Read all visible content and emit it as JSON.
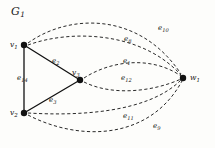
{
  "figure": {
    "title": "G",
    "title_sub": "1",
    "background_color": "#fdfdfb",
    "ink_color": "#111111"
  },
  "nodes": [
    {
      "id": "v1",
      "label": "v",
      "sub": "1",
      "x": 24,
      "y": 45,
      "label_x": 10,
      "label_y": 40
    },
    {
      "id": "v2",
      "label": "v",
      "sub": "2",
      "x": 24,
      "y": 113,
      "label_x": 10,
      "label_y": 108
    },
    {
      "id": "v3",
      "label": "v",
      "sub": "3",
      "x": 80,
      "y": 80,
      "label_x": 72,
      "label_y": 68
    },
    {
      "id": "w1",
      "label": "w",
      "sub": "1",
      "x": 183,
      "y": 78,
      "label_x": 190,
      "label_y": 73
    }
  ],
  "solid_edges": [
    {
      "id": "e14",
      "label": "e",
      "sub": "14",
      "from": "v1",
      "to": "v2",
      "label_x": 17,
      "label_y": 74
    },
    {
      "id": "e2",
      "label": "e",
      "sub": "2",
      "from": "v1",
      "to": "v3",
      "label_x": 52,
      "label_y": 57
    },
    {
      "id": "e3",
      "label": "e",
      "sub": "3",
      "from": "v2",
      "to": "v3",
      "label_x": 49,
      "label_y": 96
    }
  ],
  "dashed_edges": [
    {
      "id": "e10",
      "label": "e",
      "sub": "10",
      "from": "v1",
      "to": "w1",
      "label_x": 158,
      "label_y": 24,
      "path": "M 28 43 C 70 13, 140 12, 181 74"
    },
    {
      "id": "e8",
      "label": "e",
      "sub": "8",
      "from": "v1",
      "to": "w1",
      "label_x": 124,
      "label_y": 35,
      "path": "M 28 45 C 72 29, 142 32, 181 75"
    },
    {
      "id": "e1",
      "label": "e",
      "sub": "1",
      "from": "v3",
      "to": "w1",
      "label_x": 123,
      "label_y": 57,
      "path": "M 84 78 C 112 60, 152 56, 181 76"
    },
    {
      "id": "e12",
      "label": "e",
      "sub": "12",
      "from": "v3",
      "to": "w1",
      "label_x": 121,
      "label_y": 74,
      "path": "M 84 82 C 112 96, 152 92, 181 79"
    },
    {
      "id": "e11",
      "label": "e",
      "sub": "11",
      "from": "v2",
      "to": "w1",
      "label_x": 123,
      "label_y": 112,
      "path": "M 28 113 C 78 116, 148 113, 181 80"
    },
    {
      "id": "e9",
      "label": "e",
      "sub": "9",
      "from": "v2",
      "to": "w1",
      "label_x": 153,
      "label_y": 122,
      "path": "M 28 115 C 80 142, 150 140, 182 81"
    }
  ],
  "style": {
    "dash_pattern": "3.2,2.4",
    "solid_stroke_width": 1.3,
    "dashed_stroke_width": 0.9,
    "node_radius": 3.2
  }
}
